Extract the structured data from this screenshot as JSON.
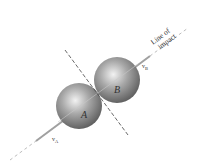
{
  "diagram": {
    "spheres": [
      {
        "label": "A",
        "cx": 79,
        "cy": 106,
        "r": 23
      },
      {
        "label": "B",
        "cx": 117,
        "cy": 80,
        "r": 23
      }
    ],
    "line_of_impact": {
      "label_line1": "Line of",
      "label_line2": "impact"
    },
    "velocity_labels": {
      "va": "v",
      "va_sub": "A",
      "vb": "v",
      "vb_sub": "B"
    },
    "colors": {
      "sphere_light": "#e8e8e8",
      "sphere_dark": "#6e6e6e",
      "line": "#9a9a9a",
      "dash": "#444444"
    }
  }
}
